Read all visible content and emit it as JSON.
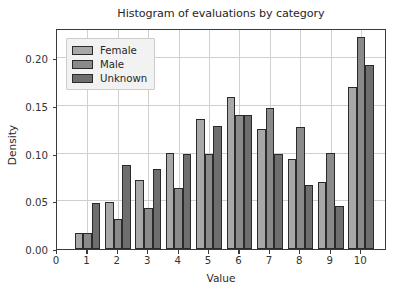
{
  "chart_data": {
    "type": "bar",
    "title": "Histogram of evaluations by category",
    "xlabel": "Value",
    "ylabel": "Density",
    "categories": [
      "1",
      "2",
      "3",
      "4",
      "5",
      "6",
      "7",
      "8",
      "9",
      "10"
    ],
    "series": [
      {
        "name": "Female",
        "color": "#a8a8a8",
        "values": [
          0.017,
          0.049,
          0.072,
          0.101,
          0.136,
          0.159,
          0.126,
          0.094,
          0.07,
          0.17
        ]
      },
      {
        "name": "Male",
        "color": "#8a8a8a",
        "values": [
          0.017,
          0.031,
          0.043,
          0.064,
          0.1,
          0.14,
          0.148,
          0.128,
          0.101,
          0.222
        ]
      },
      {
        "name": "Unknown",
        "color": "#6e6e6e",
        "values": [
          0.048,
          0.088,
          0.084,
          0.1,
          0.129,
          0.14,
          0.1,
          0.067,
          0.045,
          0.193
        ]
      }
    ],
    "xlim": [
      0,
      10.85
    ],
    "ylim": [
      0.0,
      0.2315
    ],
    "yticks": [
      "0.00",
      "0.05",
      "0.10",
      "0.15",
      "0.20"
    ],
    "ytick_values": [
      0.0,
      0.05,
      0.1,
      0.15,
      0.2
    ],
    "xticks": [
      "0",
      "1",
      "2",
      "3",
      "4",
      "5",
      "6",
      "7",
      "8",
      "9",
      "10"
    ],
    "xtick_values": [
      0,
      1,
      2,
      3,
      4,
      5,
      6,
      7,
      8,
      9,
      10
    ],
    "grid": true,
    "legend_position": "upper left",
    "bar_edge_color": "#2b2b2b",
    "background": "#ffffff"
  }
}
